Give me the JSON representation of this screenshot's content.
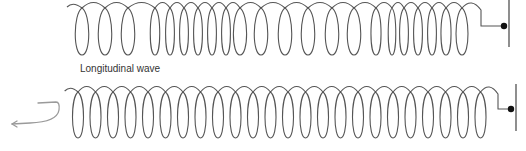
{
  "diagram": {
    "label": "Longitudinal wave",
    "colors": {
      "spring": "#555555",
      "arrow": "#9a9a9a",
      "dot": "#111111",
      "wall": "#444444",
      "label": "#333333"
    },
    "top_spring": {
      "description": "compressed and stretched coils (longitudinal wave)",
      "loop_top": 4,
      "loop_bottom": 55,
      "loop_centers": [
        82,
        105,
        128,
        155,
        170,
        184,
        198,
        212,
        226,
        240,
        261,
        285,
        308,
        332,
        354,
        376,
        392,
        404,
        418,
        432,
        446,
        462
      ],
      "end_hook_x": 481,
      "dot": {
        "x": 504,
        "y": 26
      },
      "wall": {
        "x": 509,
        "y1": 0,
        "y2": 47
      }
    },
    "bottom_spring": {
      "description": "evenly spaced coils (undisturbed spring)",
      "loop_top": 88,
      "loop_bottom": 138,
      "loop_centers": [
        78,
        95.5,
        113,
        130.5,
        148,
        165.5,
        183,
        200.5,
        218,
        235.5,
        253,
        270.5,
        288,
        305.5,
        323,
        340.5,
        358,
        375.5,
        393,
        410.5,
        428,
        445.5,
        463,
        480.5
      ],
      "end_hook_x": 498,
      "dot": {
        "x": 511,
        "y": 109
      },
      "wall": {
        "x": 516,
        "y1": 84,
        "y2": 131
      }
    },
    "arrow": {
      "description": "curved arrow indicating push/pull motion",
      "path": "M 38 103 L 56 102 Q 60 102 59 110 Q 57 122 30 123 L 12 124"
    }
  }
}
